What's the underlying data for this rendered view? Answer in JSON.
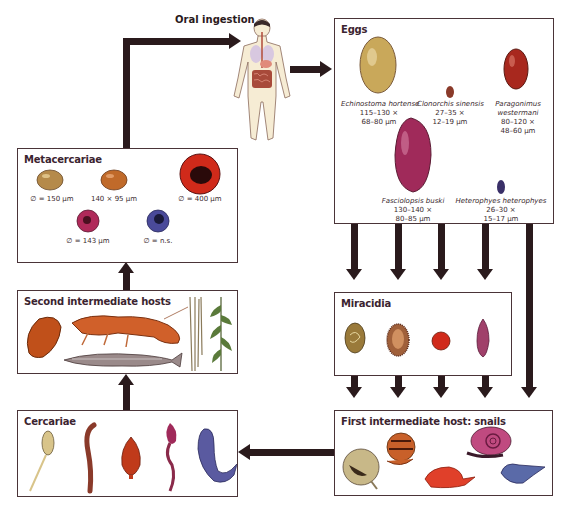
{
  "figure": {
    "oral_ingestion_label": "Oral ingestion",
    "human_icon": "human-body-digestive-icon"
  },
  "eggs": {
    "title": "Eggs",
    "items": [
      {
        "species": "Echinostoma hortense",
        "size_line1": "115–130 ×",
        "size_line2": "68–80 µm",
        "color": "#c9a85a"
      },
      {
        "species": "Clonorchis sinensis",
        "size_line1": "27–35 ×",
        "size_line2": "12–19 µm",
        "color": "#8a3a2a"
      },
      {
        "species_line1": "Paragonimus",
        "species_line2": "westermani",
        "size_line1": "80–120 ×",
        "size_line2": "48–60 µm",
        "color": "#a8281e"
      },
      {
        "species": "Fasciolopsis buski",
        "size_line1": "130–140 ×",
        "size_line2": "80–85 µm",
        "color": "#a02a5a"
      },
      {
        "species": "Heterophyes heterophyes",
        "size_line1": "26–30 ×",
        "size_line2": "15–17 µm",
        "color": "#3a3068"
      }
    ]
  },
  "metacercariae": {
    "title": "Metacercariae",
    "items": [
      {
        "label": "∅ = 150 µm",
        "color": "#b58a4a"
      },
      {
        "label": "140 × 95 µm",
        "color": "#c06a2a"
      },
      {
        "label": "∅ = 400 µm",
        "color": "#d02a1a"
      },
      {
        "label": "∅ = 143 µm",
        "color": "#b02a5a"
      },
      {
        "label": "∅ = n.s.",
        "color": "#4a4a9a"
      }
    ]
  },
  "second_hosts": {
    "title": "Second intermediate hosts",
    "items": [
      "clam",
      "crayfish",
      "fish",
      "water-plant-stems",
      "water-plant-leaves"
    ]
  },
  "cercariae": {
    "title": "Cercariae",
    "colors": [
      "#d8c48a",
      "#8a3a2a",
      "#c03a1a",
      "#a02a5a",
      "#5a5aa0"
    ]
  },
  "miracidia": {
    "title": "Miracidia",
    "colors": [
      "#9a7a3a",
      "#a0603a",
      "#d02a1a",
      "#a0406a"
    ]
  },
  "first_host": {
    "title": "First intermediate host: snails",
    "colors": [
      "#c8b888",
      "#c8602a",
      "#e0402a",
      "#c04a80",
      "#5a6aa8"
    ]
  }
}
